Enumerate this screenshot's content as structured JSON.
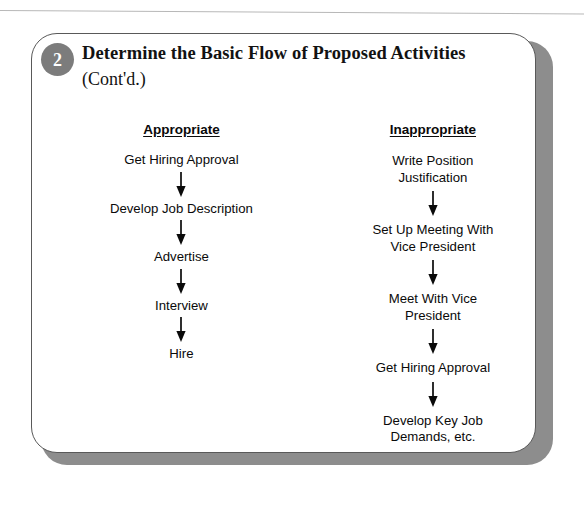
{
  "card": {
    "badge_number": "2",
    "title": "Determine the Basic Flow of Proposed Activities",
    "subtitle": "(Cont'd.)",
    "badge_color": "#7c7c7c",
    "border_color": "#595959",
    "shadow_color": "#8d8d8d"
  },
  "columns": [
    {
      "header": "Appropriate",
      "steps": [
        "Get Hiring Approval",
        "Develop Job Description",
        "Advertise",
        "Interview",
        "Hire"
      ]
    },
    {
      "header": "Inappropriate",
      "steps": [
        "Write Position\nJustification",
        "Set Up Meeting With\nVice President",
        "Meet With Vice\nPresident",
        "Get Hiring Approval",
        "Develop Key Job\nDemands, etc."
      ]
    }
  ]
}
